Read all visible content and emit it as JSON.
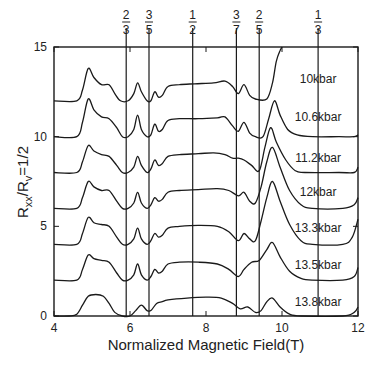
{
  "chart_data": {
    "type": "line",
    "title": "",
    "xlabel": "Normalized Magnetic Field(T)",
    "ylabel": "R_xx/R_y=1/2",
    "ylabel_parts": {
      "r1": "R",
      "s1": "xx",
      "slash": "/R",
      "s2": "v",
      "tail": "=1/2"
    },
    "xlim": [
      4,
      12
    ],
    "ylim": [
      0,
      15
    ],
    "x_ticks": [
      4,
      6,
      8,
      10,
      12
    ],
    "y_ticks": [
      0,
      5,
      10,
      15
    ],
    "grid": false,
    "legend_position": "inline-right",
    "filling_factor_lines": [
      {
        "num": "2",
        "den": "3",
        "x": 5.9
      },
      {
        "num": "3",
        "den": "5",
        "x": 6.5
      },
      {
        "num": "1",
        "den": "2",
        "x": 7.65
      },
      {
        "num": "3",
        "den": "7",
        "x": 8.8
      },
      {
        "num": "2",
        "den": "5",
        "x": 9.4
      },
      {
        "num": "1",
        "den": "3",
        "x": 10.95
      }
    ],
    "series": [
      {
        "name": "10kbar",
        "offset": 12,
        "label_x": 10.95,
        "label_y": 13.0,
        "points": [
          [
            4,
            12
          ],
          [
            4.6,
            12
          ],
          [
            4.75,
            12.6
          ],
          [
            4.9,
            13.8
          ],
          [
            5.05,
            13.3
          ],
          [
            5.25,
            12.9
          ],
          [
            5.45,
            12.9
          ],
          [
            5.6,
            12.4
          ],
          [
            5.75,
            12.0
          ],
          [
            5.95,
            12.0
          ],
          [
            6.1,
            12.4
          ],
          [
            6.2,
            13.0
          ],
          [
            6.3,
            12.5
          ],
          [
            6.45,
            12.0
          ],
          [
            6.55,
            12.0
          ],
          [
            6.65,
            12.5
          ],
          [
            6.75,
            12.2
          ],
          [
            6.85,
            12.3
          ],
          [
            7.0,
            12.8
          ],
          [
            7.3,
            12.9
          ],
          [
            7.7,
            12.95
          ],
          [
            8.2,
            13.0
          ],
          [
            8.5,
            13.1
          ],
          [
            8.7,
            12.8
          ],
          [
            8.85,
            12.4
          ],
          [
            9.0,
            12.9
          ],
          [
            9.15,
            12.3
          ],
          [
            9.3,
            12.1
          ],
          [
            9.6,
            12.1
          ],
          [
            9.75,
            13.0
          ],
          [
            9.85,
            14.2
          ],
          [
            9.95,
            14.8
          ],
          [
            10.0,
            15
          ]
        ]
      },
      {
        "name": "10.6kbar",
        "offset": 10,
        "label_x": 10.95,
        "label_y": 10.9,
        "points": [
          [
            4,
            10
          ],
          [
            4.6,
            10
          ],
          [
            4.75,
            10.8
          ],
          [
            4.9,
            12.1
          ],
          [
            5.05,
            11.5
          ],
          [
            5.25,
            11.1
          ],
          [
            5.45,
            11.0
          ],
          [
            5.65,
            10.5
          ],
          [
            5.8,
            10.0
          ],
          [
            5.95,
            10.0
          ],
          [
            6.1,
            10.4
          ],
          [
            6.2,
            11.2
          ],
          [
            6.3,
            10.4
          ],
          [
            6.45,
            10.0
          ],
          [
            6.55,
            10.1
          ],
          [
            6.65,
            10.7
          ],
          [
            6.75,
            10.3
          ],
          [
            6.85,
            10.4
          ],
          [
            7.0,
            10.9
          ],
          [
            7.3,
            11.0
          ],
          [
            7.8,
            11.0
          ],
          [
            8.3,
            11.05
          ],
          [
            8.5,
            11.1
          ],
          [
            8.7,
            10.6
          ],
          [
            8.85,
            10.3
          ],
          [
            9.0,
            10.8
          ],
          [
            9.15,
            10.2
          ],
          [
            9.3,
            10.0
          ],
          [
            9.5,
            10.0
          ],
          [
            9.65,
            11.0
          ],
          [
            9.8,
            12.0
          ],
          [
            9.95,
            11.2
          ],
          [
            10.15,
            10.4
          ],
          [
            10.4,
            10.1
          ],
          [
            10.8,
            10.0
          ],
          [
            11.5,
            10.0
          ],
          [
            11.9,
            10.0
          ],
          [
            12,
            10.1
          ]
        ]
      },
      {
        "name": "11.2kbar",
        "offset": 8,
        "label_x": 10.95,
        "label_y": 8.6,
        "points": [
          [
            4,
            8
          ],
          [
            4.6,
            8
          ],
          [
            4.75,
            8.6
          ],
          [
            4.9,
            9.5
          ],
          [
            5.05,
            9.2
          ],
          [
            5.25,
            9.0
          ],
          [
            5.45,
            8.9
          ],
          [
            5.65,
            8.4
          ],
          [
            5.8,
            8.0
          ],
          [
            5.95,
            8.0
          ],
          [
            6.1,
            8.3
          ],
          [
            6.2,
            8.9
          ],
          [
            6.3,
            8.4
          ],
          [
            6.45,
            8.0
          ],
          [
            6.55,
            8.2
          ],
          [
            6.65,
            8.7
          ],
          [
            6.75,
            8.4
          ],
          [
            6.85,
            8.5
          ],
          [
            7.0,
            8.9
          ],
          [
            7.3,
            9.0
          ],
          [
            7.8,
            9.05
          ],
          [
            8.2,
            9.1
          ],
          [
            8.5,
            9.0
          ],
          [
            8.7,
            8.8
          ],
          [
            8.85,
            8.8
          ],
          [
            9.0,
            8.7
          ],
          [
            9.2,
            8.4
          ],
          [
            9.4,
            8.1
          ],
          [
            9.55,
            9.4
          ],
          [
            9.7,
            10.5
          ],
          [
            9.85,
            9.7
          ],
          [
            10.1,
            8.7
          ],
          [
            10.35,
            8.1
          ],
          [
            10.6,
            8.0
          ],
          [
            11.5,
            8.0
          ],
          [
            11.9,
            8.0
          ],
          [
            12,
            8.3
          ]
        ]
      },
      {
        "name": "12kbar",
        "offset": 6,
        "label_x": 10.95,
        "label_y": 6.7,
        "points": [
          [
            4,
            6
          ],
          [
            4.6,
            6
          ],
          [
            4.75,
            6.6
          ],
          [
            4.9,
            7.5
          ],
          [
            5.05,
            7.2
          ],
          [
            5.25,
            7.0
          ],
          [
            5.45,
            7.0
          ],
          [
            5.65,
            6.4
          ],
          [
            5.8,
            6.0
          ],
          [
            5.95,
            6.0
          ],
          [
            6.1,
            6.3
          ],
          [
            6.2,
            6.9
          ],
          [
            6.3,
            6.3
          ],
          [
            6.45,
            6.0
          ],
          [
            6.55,
            6.2
          ],
          [
            6.65,
            6.6
          ],
          [
            6.75,
            6.4
          ],
          [
            6.85,
            6.5
          ],
          [
            7.0,
            6.9
          ],
          [
            7.3,
            7.0
          ],
          [
            7.8,
            7.05
          ],
          [
            8.3,
            7.1
          ],
          [
            8.6,
            7.0
          ],
          [
            8.85,
            6.7
          ],
          [
            9.0,
            6.9
          ],
          [
            9.15,
            6.4
          ],
          [
            9.3,
            6.3
          ],
          [
            9.45,
            7.2
          ],
          [
            9.6,
            8.6
          ],
          [
            9.75,
            9.4
          ],
          [
            9.95,
            8.3
          ],
          [
            10.2,
            7.0
          ],
          [
            10.5,
            6.2
          ],
          [
            10.8,
            6.0
          ],
          [
            11.6,
            6.0
          ],
          [
            11.9,
            6.2
          ],
          [
            12,
            6.6
          ]
        ]
      },
      {
        "name": "13.3kbar",
        "offset": 4,
        "label_x": 10.95,
        "label_y": 4.7,
        "points": [
          [
            4,
            4
          ],
          [
            4.6,
            4
          ],
          [
            4.75,
            4.6
          ],
          [
            4.9,
            5.5
          ],
          [
            5.05,
            5.2
          ],
          [
            5.25,
            5.1
          ],
          [
            5.45,
            5.0
          ],
          [
            5.65,
            4.4
          ],
          [
            5.8,
            4.0
          ],
          [
            5.95,
            4.0
          ],
          [
            6.1,
            4.3
          ],
          [
            6.2,
            4.9
          ],
          [
            6.3,
            4.3
          ],
          [
            6.45,
            4.0
          ],
          [
            6.55,
            4.2
          ],
          [
            6.65,
            4.6
          ],
          [
            6.75,
            4.4
          ],
          [
            6.85,
            4.5
          ],
          [
            7.0,
            4.9
          ],
          [
            7.3,
            5.0
          ],
          [
            7.8,
            5.05
          ],
          [
            8.3,
            5.0
          ],
          [
            8.6,
            4.7
          ],
          [
            8.85,
            4.2
          ],
          [
            9.0,
            4.6
          ],
          [
            9.15,
            4.3
          ],
          [
            9.3,
            4.2
          ],
          [
            9.45,
            5.3
          ],
          [
            9.6,
            6.6
          ],
          [
            9.75,
            7.5
          ],
          [
            9.95,
            6.4
          ],
          [
            10.2,
            5.1
          ],
          [
            10.5,
            4.2
          ],
          [
            10.8,
            4.0
          ],
          [
            11.6,
            4.0
          ],
          [
            11.85,
            4.4
          ],
          [
            12,
            5.4
          ]
        ]
      },
      {
        "name": "13.5kbar",
        "offset": 2,
        "label_x": 10.95,
        "label_y": 2.6,
        "points": [
          [
            4,
            2
          ],
          [
            4.6,
            2
          ],
          [
            4.75,
            2.6
          ],
          [
            4.9,
            3.4
          ],
          [
            5.05,
            3.2
          ],
          [
            5.25,
            3.1
          ],
          [
            5.45,
            3.0
          ],
          [
            5.65,
            2.4
          ],
          [
            5.8,
            2.0
          ],
          [
            5.95,
            2.0
          ],
          [
            6.1,
            2.3
          ],
          [
            6.2,
            2.9
          ],
          [
            6.3,
            2.3
          ],
          [
            6.45,
            2.0
          ],
          [
            6.55,
            2.2
          ],
          [
            6.65,
            2.6
          ],
          [
            6.75,
            2.4
          ],
          [
            6.85,
            2.5
          ],
          [
            7.0,
            2.9
          ],
          [
            7.3,
            3.0
          ],
          [
            7.8,
            3.0
          ],
          [
            8.3,
            2.9
          ],
          [
            8.6,
            2.6
          ],
          [
            8.85,
            2.2
          ],
          [
            9.0,
            2.6
          ],
          [
            9.2,
            3.0
          ],
          [
            9.4,
            3.1
          ],
          [
            9.6,
            3.7
          ],
          [
            9.75,
            4.1
          ],
          [
            9.95,
            3.3
          ],
          [
            10.2,
            2.5
          ],
          [
            10.5,
            2.1
          ],
          [
            10.8,
            2.0
          ],
          [
            11.6,
            2.0
          ],
          [
            11.9,
            2.2
          ],
          [
            12,
            2.7
          ]
        ]
      },
      {
        "name": "13.8kbar",
        "offset": 0,
        "label_x": 10.95,
        "label_y": 0.55,
        "points": [
          [
            4,
            0
          ],
          [
            4.4,
            0
          ],
          [
            4.6,
            0.1
          ],
          [
            4.75,
            0.6
          ],
          [
            4.9,
            1.1
          ],
          [
            5.1,
            1.2
          ],
          [
            5.3,
            1.1
          ],
          [
            5.45,
            0.7
          ],
          [
            5.6,
            0.2
          ],
          [
            5.8,
            0.0
          ],
          [
            6.0,
            0.0
          ],
          [
            6.15,
            0.3
          ],
          [
            6.3,
            0.6
          ],
          [
            6.45,
            0.3
          ],
          [
            6.55,
            0.3
          ],
          [
            6.7,
            0.7
          ],
          [
            6.85,
            0.8
          ],
          [
            7.0,
            0.9
          ],
          [
            7.5,
            1.0
          ],
          [
            8.0,
            1.05
          ],
          [
            8.4,
            1.0
          ],
          [
            8.7,
            0.7
          ],
          [
            8.9,
            0.4
          ],
          [
            9.1,
            0.5
          ],
          [
            9.3,
            0.2
          ],
          [
            9.45,
            0.3
          ],
          [
            9.6,
            0.8
          ],
          [
            9.75,
            1.0
          ],
          [
            9.95,
            0.5
          ],
          [
            10.2,
            0.1
          ],
          [
            10.5,
            0.0
          ],
          [
            11.6,
            0.0
          ],
          [
            11.9,
            0.2
          ],
          [
            12,
            0.5
          ]
        ]
      }
    ]
  }
}
